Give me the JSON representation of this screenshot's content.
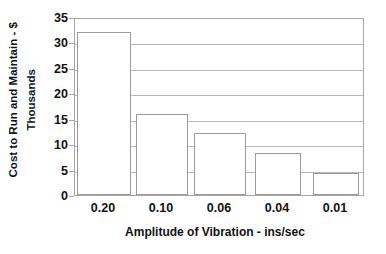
{
  "chart_data": {
    "type": "bar",
    "title": "",
    "subtitle": "",
    "xlabel": "Amplitude of Vibration - ins/sec",
    "ylabel": "Cost to Run and Maintain - $ Thousands",
    "ylabel_line1": "Cost to Run and Maintain - $",
    "ylabel_line2": "Thousands",
    "categories": [
      "0.20",
      "0.10",
      "0.06",
      "0.04",
      "0.01"
    ],
    "values": [
      32,
      16,
      12.2,
      8.2,
      4.3
    ],
    "ylim": [
      0,
      35
    ],
    "yticks": [
      0,
      5,
      10,
      15,
      20,
      25,
      30,
      35
    ],
    "ytick_labels": [
      "0",
      "5",
      "10",
      "15",
      "20",
      "25",
      "30",
      "35"
    ],
    "grid": true,
    "grid_axis": "y",
    "legend": false,
    "legend_position": "none",
    "bar_fill_color": "#ffffff",
    "bar_border_color": "#9b9b9b",
    "axis_color": "#a6a6a6",
    "grid_color": "#b7b7b7",
    "text_color": "#111111",
    "background_color": "#ffffff"
  }
}
